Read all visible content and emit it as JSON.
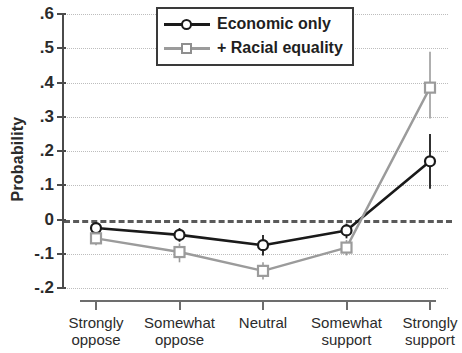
{
  "chart_data": {
    "type": "line",
    "title": "",
    "xlabel": "",
    "ylabel": "Probability",
    "ylim": [
      -0.2,
      0.6
    ],
    "yticks": [
      0.6,
      0.5,
      0.4,
      0.3,
      0.2,
      0.1,
      0,
      -0.1,
      -0.2
    ],
    "ytick_labels": [
      ".6",
      ".5",
      ".4",
      ".3",
      ".2",
      ".1",
      "0",
      "-.1",
      "-.2"
    ],
    "grid": true,
    "grid_style": "dotted horizontal",
    "zero_reference_line": 0,
    "legend_position": "top-center",
    "categories": [
      "Strongly oppose",
      "Somewhat oppose",
      "Neutral",
      "Somewhat support",
      "Strongly support"
    ],
    "category_lines": [
      [
        "Strongly",
        "oppose"
      ],
      [
        "Somewhat",
        "oppose"
      ],
      [
        "Neutral",
        ""
      ],
      [
        "Somewhat",
        "support"
      ],
      [
        "Strongly",
        "support"
      ]
    ],
    "series": [
      {
        "name": "Economic only",
        "color": "#1a1a1a",
        "marker": "circle-open",
        "values": [
          -0.025,
          -0.045,
          -0.075,
          -0.032,
          0.17
        ],
        "err_low": [
          -0.04,
          -0.065,
          -0.105,
          -0.055,
          0.09
        ],
        "err_high": [
          -0.012,
          -0.025,
          -0.045,
          -0.012,
          0.25
        ]
      },
      {
        "name": "+ Racial equality",
        "color": "#9b9b9b",
        "marker": "square-open",
        "values": [
          -0.055,
          -0.095,
          -0.15,
          -0.082,
          0.385
        ],
        "err_low": [
          -0.075,
          -0.125,
          -0.175,
          -0.105,
          0.295
        ],
        "err_high": [
          -0.04,
          -0.07,
          -0.125,
          -0.06,
          0.49
        ]
      }
    ]
  },
  "legend": {
    "items": [
      {
        "label": "Economic only",
        "color": "#1a1a1a",
        "marker": "circle-open"
      },
      {
        "label": "+ Racial equality",
        "color": "#9b9b9b",
        "marker": "square-open"
      }
    ]
  },
  "axes": {
    "y_title": "Probability"
  }
}
